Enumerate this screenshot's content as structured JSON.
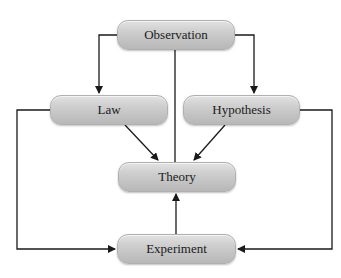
{
  "diagram": {
    "nodes": {
      "observation": "Observation",
      "law": "Law",
      "hypothesis": "Hypothesis",
      "theory": "Theory",
      "experiment": "Experiment"
    },
    "edges": [
      {
        "from": "Observation",
        "to": "Law"
      },
      {
        "from": "Observation",
        "to": "Hypothesis"
      },
      {
        "from": "Observation",
        "to": "Theory"
      },
      {
        "from": "Law",
        "to": "Theory"
      },
      {
        "from": "Hypothesis",
        "to": "Theory"
      },
      {
        "from": "Law",
        "to": "Experiment"
      },
      {
        "from": "Hypothesis",
        "to": "Experiment"
      },
      {
        "from": "Experiment",
        "to": "Theory"
      }
    ],
    "colors": {
      "node_fill": "#c8c8c8",
      "line": "#1a1a1a"
    }
  }
}
